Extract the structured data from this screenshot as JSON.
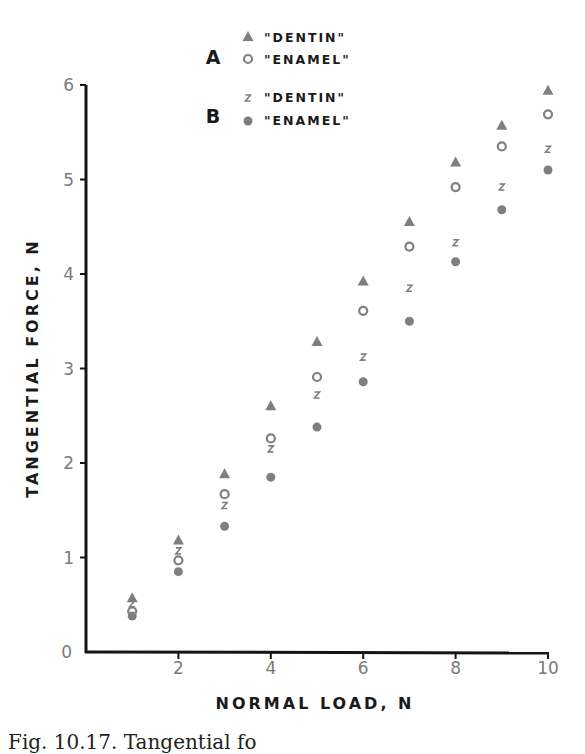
{
  "chart_data": {
    "type": "scatter",
    "title": "",
    "xlabel": "NORMAL LOAD, N",
    "ylabel": "TANGENTIAL FORCE, N",
    "xlim": [
      0,
      10
    ],
    "ylim": [
      0,
      6
    ],
    "x_ticks": [
      0,
      2,
      4,
      6,
      8,
      10
    ],
    "y_ticks": [
      0,
      1,
      2,
      3,
      4,
      5,
      6
    ],
    "grid": false,
    "legend_position": "top-center",
    "legend": [
      {
        "group": "A",
        "label": "\"DENTIN\"",
        "marker": "triangle-filled"
      },
      {
        "group": "A",
        "label": "\"ENAMEL\"",
        "marker": "circle-open"
      },
      {
        "group": "B",
        "label": "\"DENTIN\"",
        "marker": "x-small"
      },
      {
        "group": "B",
        "label": "\"ENAMEL\"",
        "marker": "circle-filled"
      }
    ],
    "x": [
      1,
      2,
      3,
      4,
      5,
      6,
      7,
      8,
      9,
      10
    ],
    "series": [
      {
        "name": "A \"DENTIN\"",
        "marker": "triangle-filled",
        "values": [
          0.57,
          1.18,
          1.88,
          2.6,
          3.28,
          3.92,
          4.55,
          5.18,
          5.57,
          5.94
        ]
      },
      {
        "name": "A \"ENAMEL\"",
        "marker": "circle-open",
        "values": [
          0.43,
          0.97,
          1.67,
          2.26,
          2.91,
          3.61,
          4.29,
          4.92,
          5.35,
          5.69
        ]
      },
      {
        "name": "B \"DENTIN\"",
        "marker": "x-small",
        "values": [
          0.51,
          1.07,
          1.55,
          2.15,
          2.72,
          3.12,
          3.85,
          4.33,
          4.92,
          5.32
        ]
      },
      {
        "name": "B \"ENAMEL\"",
        "marker": "circle-filled",
        "values": [
          0.38,
          0.85,
          1.33,
          1.85,
          2.38,
          2.86,
          3.5,
          4.13,
          4.68,
          5.1
        ]
      }
    ]
  },
  "legend": {
    "group_a": "A",
    "group_b": "B",
    "a_dentin": "\"DENTIN\"",
    "a_enamel": "\"ENAMEL\"",
    "b_dentin": "\"DENTIN\"",
    "b_enamel": "\"ENAMEL\""
  },
  "axes": {
    "xlabel": "NORMAL LOAD, N",
    "ylabel": "TANGENTIAL FORCE, N",
    "x_tick_labels": [
      "0",
      "2",
      "4",
      "6",
      "8",
      "10"
    ],
    "y_tick_labels": [
      "0",
      "1",
      "2",
      "3",
      "4",
      "5",
      "6"
    ]
  },
  "caption": "Fig. 10.17. Tangential fo",
  "colors": {
    "marker": "#7f7f7f",
    "axis": "#151515",
    "text": "#1a1a1a",
    "tick_text": "#7a7a7a"
  }
}
